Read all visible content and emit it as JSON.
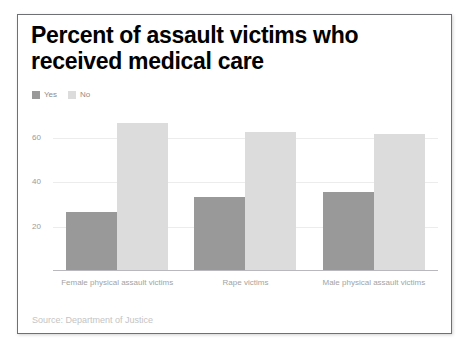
{
  "card": {
    "title_line1": "Percent of assault victims who",
    "title_line2": "received medical care",
    "source": "Source: Department of Justice"
  },
  "legend": {
    "items": [
      {
        "label": "Yes",
        "color": "#999999",
        "icon": "legend-swatch-icon"
      },
      {
        "label": "No",
        "color": "#dcdcdc",
        "icon": "legend-swatch-icon"
      }
    ]
  },
  "axis": {
    "yticks": [
      "60",
      "40",
      "20"
    ]
  },
  "chart_data": {
    "type": "bar",
    "title": "Percent of assault victims who received medical care",
    "subtitle": "",
    "xlabel": "",
    "ylabel": "",
    "ylim": [
      0,
      72
    ],
    "yticks": [
      20,
      40,
      60
    ],
    "grid": true,
    "legend_position": "top-left",
    "categories": [
      "Female physical assault victims",
      "Rape victims",
      "Male physical assault victims"
    ],
    "series": [
      {
        "name": "Yes",
        "color": "#999999",
        "values": [
          26,
          33,
          35
        ]
      },
      {
        "name": "No",
        "color": "#dcdcdc",
        "values": [
          66,
          62,
          61
        ]
      }
    ],
    "annotations": [
      "Source: Department of Justice"
    ]
  }
}
